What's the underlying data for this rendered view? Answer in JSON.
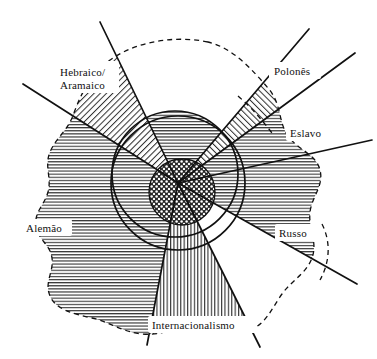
{
  "figure": {
    "type": "venn-sector-diagram",
    "background_color": "#ffffff",
    "line_color": "#111111",
    "labels": [
      {
        "id": "hebraico-aramaico",
        "text_line1": "Hebraico/",
        "text_line2": "Aramaico",
        "x": 60,
        "y": 76,
        "pattern": "diagonal-hatch-right",
        "sector": "upper-left"
      },
      {
        "id": "polones",
        "text_line1": "Polonês",
        "text_line2": "",
        "x": 274,
        "y": 74,
        "pattern": "diagonal-hatch-left",
        "sector": "upper-right"
      },
      {
        "id": "eslavo",
        "text_line1": "Eslavo",
        "text_line2": "",
        "x": 290,
        "y": 136,
        "pattern": "horizontal-hatch",
        "sector": "right-upper"
      },
      {
        "id": "russo",
        "text_line1": "Russo",
        "text_line2": "",
        "x": 279,
        "y": 236,
        "pattern": "horizontal-hatch",
        "sector": "right-lower"
      },
      {
        "id": "alemao",
        "text_line1": "Alemão",
        "text_line2": "",
        "x": 26,
        "y": 231,
        "pattern": "horizontal-hatch",
        "sector": "left"
      },
      {
        "id": "internacionalismo",
        "text_line1": "Internacionalismo",
        "text_line2": "",
        "x": 152,
        "y": 328,
        "pattern": "vertical-hatch",
        "sector": "bottom"
      }
    ],
    "circles": [
      {
        "id": "outer-circle",
        "cx": 178,
        "cy": 183,
        "r": 67,
        "stroke_width": 1.6
      },
      {
        "id": "secondary-circle",
        "cx": 175,
        "cy": 174,
        "r": 63,
        "stroke_width": 1.6
      },
      {
        "id": "core-circle",
        "cx": 182,
        "cy": 192,
        "r": 33,
        "stroke_width": 1.4,
        "pattern": "stipple"
      }
    ],
    "radial_lines": [
      {
        "id": "ray-upper-left",
        "x1": 178,
        "y1": 183,
        "x2": 23,
        "y2": 84
      },
      {
        "id": "ray-upper-left-2",
        "x1": 178,
        "y1": 183,
        "x2": 100,
        "y2": 22
      },
      {
        "id": "ray-upper-right",
        "x1": 178,
        "y1": 183,
        "x2": 309,
        "y2": 29
      },
      {
        "id": "ray-upper-right-2",
        "x1": 178,
        "y1": 183,
        "x2": 355,
        "y2": 53
      },
      {
        "id": "ray-right",
        "x1": 178,
        "y1": 183,
        "x2": 372,
        "y2": 140
      },
      {
        "id": "ray-right-lower",
        "x1": 178,
        "y1": 183,
        "x2": 357,
        "y2": 284
      },
      {
        "id": "ray-bottom-right",
        "x1": 178,
        "y1": 183,
        "x2": 260,
        "y2": 347
      },
      {
        "id": "ray-bottom-left",
        "x1": 178,
        "y1": 183,
        "x2": 147,
        "y2": 345
      }
    ],
    "dashed_boundary_name": "outer-blob-dashed-outline",
    "dashed_arcs": [
      {
        "id": "polones-dashed-arc"
      },
      {
        "id": "russo-dashed-arc"
      }
    ]
  }
}
